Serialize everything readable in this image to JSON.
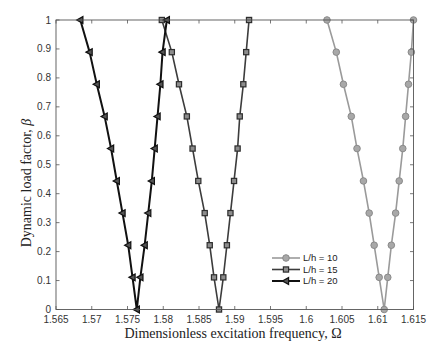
{
  "chart_data": {
    "type": "line",
    "title": "",
    "xlabel": "Dimensionless excitation frequency, Ω",
    "ylabel": "Dynamic load factor, β",
    "xlim": [
      1.565,
      1.615
    ],
    "ylim": [
      0,
      1
    ],
    "xticks": [
      1.565,
      1.57,
      1.575,
      1.58,
      1.585,
      1.59,
      1.595,
      1.6,
      1.605,
      1.61,
      1.615
    ],
    "xtick_labels": [
      "1.565",
      "1.57",
      "1.575",
      "1.58",
      "1.585",
      "1.59",
      "1.595",
      "1.6",
      "1.605",
      "1.61",
      "1.615"
    ],
    "yticks": [
      0,
      0.1,
      0.2,
      0.3,
      0.4,
      0.5,
      0.6,
      0.7,
      0.8,
      0.9,
      1
    ],
    "ytick_labels": [
      "0",
      "0.1",
      "0.2",
      "0.3",
      "0.4",
      "0.5",
      "0.6",
      "0.7",
      "0.8",
      "0.9",
      "1"
    ],
    "grid": false,
    "box": true,
    "legend_position": "lower right (inside, near x=1.596-1.606, y=0.1-0.2)",
    "series": [
      {
        "name": "L/h = 10",
        "color": "#9a9a9a",
        "marker": "circle",
        "marker_fill": "#a8a8a8",
        "marker_edge": "#8a8a8a",
        "x": [
          1.6029,
          1.6042,
          1.6052,
          1.6063,
          1.6071,
          1.608,
          1.6088,
          1.6095,
          1.6102,
          1.6109,
          1.6114,
          1.6119,
          1.6125,
          1.613,
          1.6135,
          1.6139,
          1.6143,
          1.6147,
          1.615
        ],
        "y": [
          1,
          0.889,
          0.778,
          0.667,
          0.556,
          0.444,
          0.333,
          0.222,
          0.111,
          0,
          0.111,
          0.222,
          0.333,
          0.444,
          0.556,
          0.667,
          0.778,
          0.889,
          1
        ]
      },
      {
        "name": "L/h = 15",
        "color": "#3c3c3c",
        "marker": "square",
        "marker_fill": "#8c8c8c",
        "marker_edge": "#2e2e2e",
        "x": [
          1.5798,
          1.5812,
          1.5822,
          1.5833,
          1.5841,
          1.5849,
          1.5858,
          1.5865,
          1.5871,
          1.5878,
          1.5884,
          1.5889,
          1.5894,
          1.5899,
          1.5904,
          1.5907,
          1.5912,
          1.5916,
          1.592
        ],
        "y": [
          1,
          0.889,
          0.778,
          0.667,
          0.556,
          0.444,
          0.333,
          0.222,
          0.111,
          0,
          0.111,
          0.222,
          0.333,
          0.444,
          0.556,
          0.667,
          0.778,
          0.889,
          1
        ]
      },
      {
        "name": "L/h = 20",
        "color": "#111111",
        "marker": "triangle-left",
        "marker_fill": "#555555",
        "marker_edge": "#111111",
        "x": [
          1.5684,
          1.5697,
          1.5707,
          1.5718,
          1.5727,
          1.5735,
          1.5743,
          1.5751,
          1.5757,
          1.5763,
          1.5768,
          1.5774,
          1.5779,
          1.5784,
          1.5788,
          1.5792,
          1.5796,
          1.5799,
          1.5805
        ],
        "y": [
          1,
          0.889,
          0.778,
          0.667,
          0.556,
          0.444,
          0.333,
          0.222,
          0.111,
          0,
          0.111,
          0.222,
          0.333,
          0.444,
          0.556,
          0.667,
          0.778,
          0.889,
          1
        ]
      }
    ]
  },
  "labels": {
    "xlabel_text": "Dimensionless excitation frequency, ",
    "xlabel_symbol": "Ω",
    "ylabel_text": "Dynamic load factor, ",
    "ylabel_symbol": "β"
  },
  "style": {
    "axis_color": "#555555"
  }
}
